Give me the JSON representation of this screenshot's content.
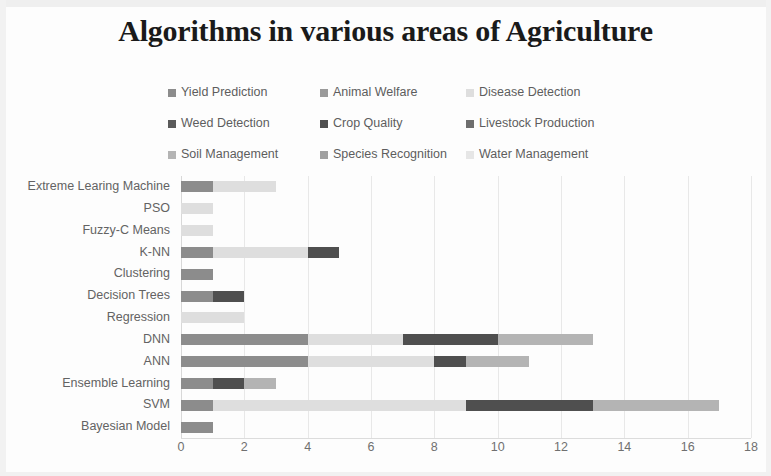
{
  "chart_data": {
    "type": "bar",
    "orientation": "horizontal",
    "stacked": true,
    "title": "Algorithms in various areas of Agriculture",
    "xlabel": "",
    "ylabel": "",
    "xlim": [
      0,
      18
    ],
    "xticks": [
      "0",
      "2",
      "4",
      "6",
      "8",
      "10",
      "12",
      "14",
      "16",
      "18"
    ],
    "xtick_values": [
      0,
      2,
      4,
      6,
      8,
      10,
      12,
      14,
      16,
      18
    ],
    "grid": true,
    "grid_axis": "x",
    "legend_position": "top",
    "legend_columns": 3,
    "categories": [
      "Extreme Learing Machine",
      "PSO",
      "Fuzzy-C Means",
      "K-NN",
      "Clustering",
      "Decision Trees",
      "Regression",
      "DNN",
      "ANN",
      "Ensemble Learning",
      "SVM",
      "Bayesian Model"
    ],
    "series": [
      {
        "name": "Yield Prediction",
        "color": "#8c8c8c",
        "values": [
          1,
          0,
          0,
          1,
          1,
          1,
          0,
          4,
          4,
          1,
          1,
          1
        ]
      },
      {
        "name": "Animal Welfare",
        "color": "#9a9a9a",
        "values": [
          0,
          0,
          0,
          0,
          0,
          0,
          0,
          0,
          0,
          0,
          0,
          0
        ]
      },
      {
        "name": "Disease Detection",
        "color": "#dedede",
        "values": [
          2,
          1,
          1,
          3,
          0,
          0,
          2,
          3,
          4,
          0,
          8,
          0
        ]
      },
      {
        "name": "Weed Detection",
        "color": "#5a5a5a",
        "values": [
          0,
          0,
          0,
          0,
          0,
          0,
          0,
          0,
          0,
          0,
          0,
          0
        ]
      },
      {
        "name": "Crop Quality",
        "color": "#4f4f4f",
        "values": [
          0,
          0,
          0,
          1,
          0,
          1,
          0,
          3,
          1,
          1,
          4,
          0
        ]
      },
      {
        "name": "Livestock Production",
        "color": "#6e6e6e",
        "values": [
          0,
          0,
          0,
          0,
          0,
          0,
          0,
          0,
          0,
          0,
          0,
          0
        ]
      },
      {
        "name": "Soil Management",
        "color": "#b4b4b4",
        "values": [
          0,
          0,
          0,
          0,
          0,
          0,
          0,
          3,
          2,
          1,
          4,
          0
        ]
      },
      {
        "name": "Species Recognition",
        "color": "#a0a0a0",
        "values": [
          0,
          0,
          0,
          0,
          0,
          0,
          0,
          0,
          0,
          0,
          0,
          0
        ]
      },
      {
        "name": "Water Management",
        "color": "#e6e6e6",
        "values": [
          0,
          0,
          0,
          0,
          0,
          0,
          0,
          0,
          0,
          0,
          0,
          0
        ]
      }
    ],
    "totals": [
      3,
      1,
      1,
      5,
      1,
      2,
      2,
      13,
      11,
      3,
      17,
      1
    ]
  },
  "legend": {
    "items": [
      {
        "label": "Yield Prediction",
        "color": "#8c8c8c"
      },
      {
        "label": "Animal Welfare",
        "color": "#9a9a9a"
      },
      {
        "label": "Disease Detection",
        "color": "#dedede"
      },
      {
        "label": "Weed Detection",
        "color": "#5a5a5a"
      },
      {
        "label": "Crop Quality",
        "color": "#4f4f4f"
      },
      {
        "label": "Livestock Production",
        "color": "#6e6e6e"
      },
      {
        "label": "Soil Management",
        "color": "#b4b4b4"
      },
      {
        "label": "Species Recognition",
        "color": "#a0a0a0"
      },
      {
        "label": "Water Management",
        "color": "#e6e6e6"
      }
    ]
  }
}
